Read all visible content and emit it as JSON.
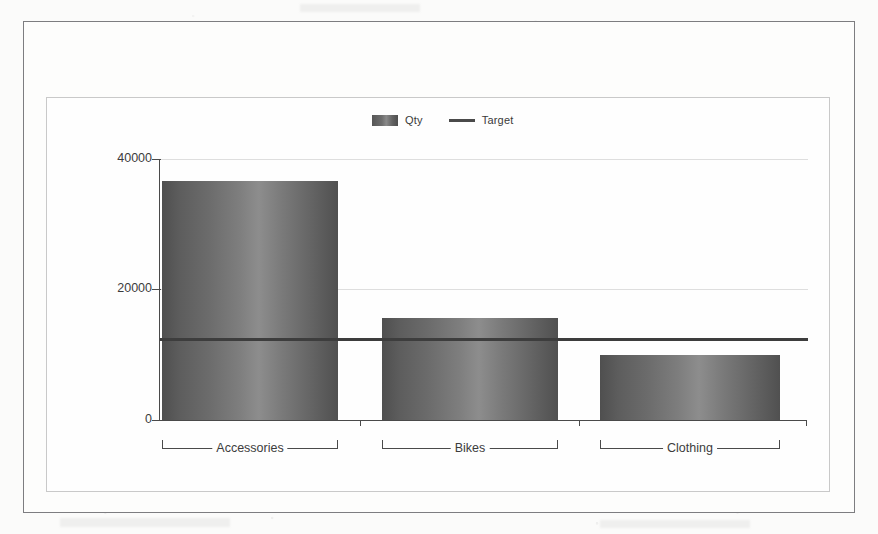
{
  "chart_data": {
    "type": "bar",
    "title": "",
    "subtitle": "",
    "xlabel": "",
    "ylabel": "",
    "categories": [
      "Accessories",
      "Bikes",
      "Clothing"
    ],
    "series": [
      {
        "name": "Qty",
        "type": "bar",
        "values": [
          36600,
          15600,
          9950
        ]
      },
      {
        "name": "Target",
        "type": "line",
        "value": 12400
      }
    ],
    "yticks": [
      0,
      20000,
      40000
    ],
    "ytick_labels": [
      "0",
      "20000",
      "40000"
    ],
    "ylim": [
      0,
      40000
    ],
    "grid": true,
    "legend_position": "top-center",
    "colors": {
      "bar": "#6e6e6e",
      "target_line": "#3d3d3d",
      "axis": "#4a4a4a",
      "gridline": "#dedede",
      "frame_outer": "#7d7d80",
      "frame_inner": "#c9c9c9",
      "background": "#fefefe"
    }
  },
  "legend": {
    "items": [
      {
        "label": "Qty",
        "marker": "swatch"
      },
      {
        "label": "Target",
        "marker": "line"
      }
    ]
  },
  "axis": {
    "y_labels": [
      "40000",
      "20000",
      "0"
    ]
  },
  "categories": {
    "items": [
      "Accessories",
      "Bikes",
      "Clothing"
    ]
  }
}
